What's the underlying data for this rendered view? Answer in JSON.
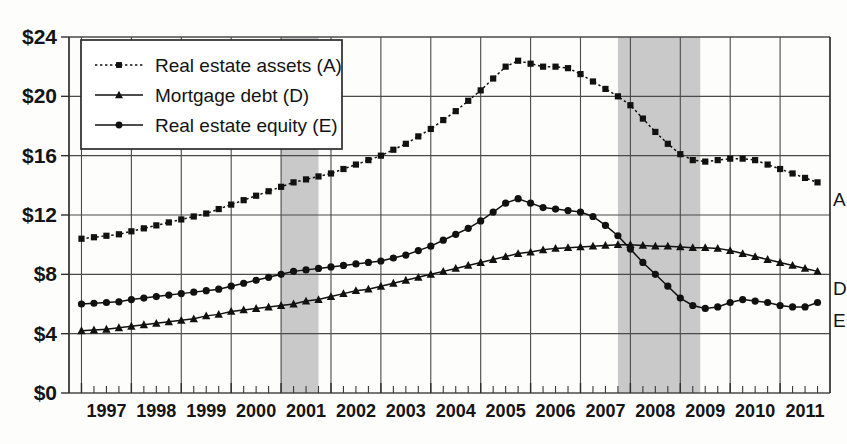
{
  "chart_data": {
    "type": "line",
    "title": "",
    "xlabel": "",
    "ylabel": "",
    "units": "trillions of dollars",
    "xlim": [
      1996.75,
      2012.0
    ],
    "ylim": [
      0,
      24
    ],
    "ytick_values": [
      0,
      4,
      8,
      12,
      16,
      20,
      24
    ],
    "ytick_labels": [
      "$0",
      "$4",
      "$8",
      "$12",
      "$16",
      "$20",
      "$24"
    ],
    "xtick_labels": [
      "1997",
      "1998",
      "1999",
      "2000",
      "2001",
      "2002",
      "2003",
      "2004",
      "2005",
      "2006",
      "2007",
      "2008",
      "2009",
      "2010",
      "2011"
    ],
    "xtick_values": [
      1997,
      1998,
      1999,
      2000,
      2001,
      2002,
      2003,
      2004,
      2005,
      2006,
      2007,
      2008,
      2009,
      2010,
      2011
    ],
    "minor_ticks_per_year": 4,
    "grid": true,
    "legend_position": "upper-left",
    "x": [
      1997.0,
      1997.25,
      1997.5,
      1997.75,
      1998.0,
      1998.25,
      1998.5,
      1998.75,
      1999.0,
      1999.25,
      1999.5,
      1999.75,
      2000.0,
      2000.25,
      2000.5,
      2000.75,
      2001.0,
      2001.25,
      2001.5,
      2001.75,
      2002.0,
      2002.25,
      2002.5,
      2002.75,
      2003.0,
      2003.25,
      2003.5,
      2003.75,
      2004.0,
      2004.25,
      2004.5,
      2004.75,
      2005.0,
      2005.25,
      2005.5,
      2005.75,
      2006.0,
      2006.25,
      2006.5,
      2006.75,
      2007.0,
      2007.25,
      2007.5,
      2007.75,
      2008.0,
      2008.25,
      2008.5,
      2008.75,
      2009.0,
      2009.25,
      2009.5,
      2009.75,
      2010.0,
      2010.25,
      2010.5,
      2010.75,
      2011.0,
      2011.25,
      2011.5,
      2011.75
    ],
    "series": [
      {
        "name": "Real estate assets (A)",
        "key": "A",
        "end_label": "A",
        "marker": "square",
        "line_style": "dotted",
        "color": "#111111",
        "values": [
          10.4,
          10.5,
          10.6,
          10.7,
          10.9,
          11.1,
          11.3,
          11.5,
          11.7,
          11.9,
          12.1,
          12.4,
          12.7,
          13.0,
          13.3,
          13.6,
          13.9,
          14.2,
          14.4,
          14.6,
          14.8,
          15.1,
          15.4,
          15.7,
          16.0,
          16.4,
          16.8,
          17.3,
          17.8,
          18.4,
          19.0,
          19.7,
          20.4,
          21.2,
          22.0,
          22.4,
          22.2,
          22.0,
          22.0,
          21.9,
          21.5,
          21.0,
          20.5,
          20.0,
          19.4,
          18.5,
          17.6,
          16.8,
          16.1,
          15.7,
          15.6,
          15.7,
          15.8,
          15.8,
          15.7,
          15.4,
          15.1,
          14.8,
          14.5,
          14.2
        ]
      },
      {
        "name": "Mortgage debt (D)",
        "key": "D",
        "end_label": "D",
        "marker": "triangle",
        "line_style": "solid",
        "color": "#111111",
        "values": [
          4.2,
          4.25,
          4.3,
          4.4,
          4.5,
          4.6,
          4.7,
          4.8,
          4.9,
          5.0,
          5.2,
          5.3,
          5.5,
          5.6,
          5.7,
          5.8,
          5.9,
          6.0,
          6.2,
          6.3,
          6.5,
          6.7,
          6.9,
          7.0,
          7.2,
          7.4,
          7.6,
          7.8,
          8.0,
          8.2,
          8.4,
          8.6,
          8.8,
          9.0,
          9.2,
          9.4,
          9.5,
          9.65,
          9.75,
          9.8,
          9.85,
          9.9,
          9.95,
          10.0,
          10.0,
          9.95,
          9.9,
          9.9,
          9.85,
          9.8,
          9.8,
          9.75,
          9.6,
          9.4,
          9.2,
          9.0,
          8.8,
          8.6,
          8.4,
          8.2
        ]
      },
      {
        "name": "Real estate equity (E)",
        "key": "E",
        "end_label": "E",
        "marker": "circle",
        "line_style": "solid",
        "color": "#111111",
        "values": [
          6.0,
          6.05,
          6.1,
          6.15,
          6.3,
          6.4,
          6.5,
          6.6,
          6.7,
          6.8,
          6.9,
          7.0,
          7.2,
          7.4,
          7.6,
          7.8,
          8.0,
          8.2,
          8.3,
          8.4,
          8.5,
          8.6,
          8.7,
          8.8,
          8.9,
          9.1,
          9.3,
          9.6,
          9.9,
          10.3,
          10.7,
          11.1,
          11.6,
          12.2,
          12.8,
          13.1,
          12.8,
          12.5,
          12.4,
          12.3,
          12.2,
          11.9,
          11.3,
          10.6,
          9.7,
          8.8,
          8.0,
          7.2,
          6.4,
          5.9,
          5.7,
          5.8,
          6.1,
          6.3,
          6.2,
          6.1,
          5.9,
          5.8,
          5.8,
          6.1
        ]
      }
    ],
    "shaded_regions": [
      {
        "name": "recession-2001",
        "start": 2001.0,
        "end": 2001.75,
        "color": "#c9c9c9"
      },
      {
        "name": "recession-2007-2009",
        "start": 2007.75,
        "end": 2009.4,
        "color": "#c9c9c9"
      }
    ]
  }
}
